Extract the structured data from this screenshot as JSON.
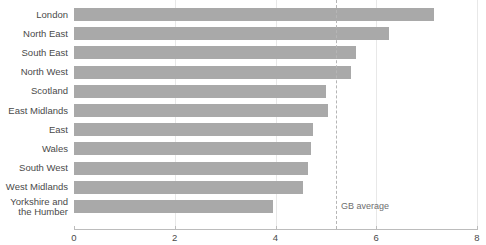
{
  "chart_data": {
    "type": "bar",
    "orientation": "horizontal",
    "title": "",
    "subtitle": "",
    "xlabel": "",
    "ylabel": "",
    "xlim": [
      0,
      8
    ],
    "xticks": [
      0,
      2,
      4,
      6,
      8
    ],
    "xtick_labels": [
      "0",
      "2",
      "4",
      "6",
      "8"
    ],
    "grid": true,
    "grid_axis": "x",
    "legend": null,
    "bar_color": "#a9a9a9",
    "categories": [
      "London",
      "North East",
      "South East",
      "North West",
      "Scotland",
      "East Midlands",
      "East",
      "Wales",
      "South West",
      "West Midlands",
      "Yorkshire and\nthe Humber"
    ],
    "values": [
      7.15,
      6.25,
      5.6,
      5.5,
      5.0,
      5.05,
      4.75,
      4.7,
      4.65,
      4.55,
      3.95
    ],
    "annotations": [
      {
        "name": "gb-average",
        "label": "GB average",
        "value": 5.2,
        "style": "dashed-vertical-line",
        "color": "#b5b5b5"
      }
    ]
  }
}
